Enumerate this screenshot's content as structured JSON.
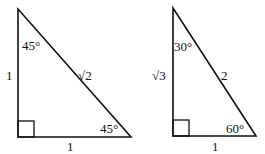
{
  "diagram": {
    "stroke_color": "#111111",
    "background": "#ffffff",
    "triangles": [
      {
        "name": "45-45-90",
        "vertices": {
          "top": [
            18,
            9
          ],
          "right_angle": [
            18,
            137
          ],
          "base_end": [
            131,
            137
          ]
        },
        "right_angle_marker_size": 16,
        "labels": {
          "top_angle": "45°",
          "vertical_side": "1",
          "hypotenuse": "√2",
          "bottom_right_angle": "45°",
          "base": "1"
        }
      },
      {
        "name": "30-60-90",
        "vertices": {
          "top": [
            173,
            8
          ],
          "right_angle": [
            173,
            136
          ],
          "base_end": [
            256,
            136
          ]
        },
        "right_angle_marker_size": 16,
        "labels": {
          "top_angle": "30°",
          "vertical_side": "√3",
          "hypotenuse": "2",
          "bottom_right_angle": "60°",
          "base": "1"
        }
      }
    ]
  }
}
